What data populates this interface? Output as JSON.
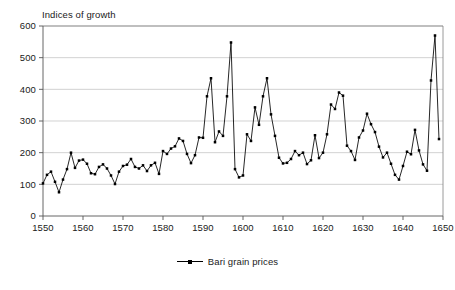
{
  "chart_data": {
    "type": "line",
    "title": "Indices of growth",
    "xlabel": "",
    "ylabel": "",
    "xlim": [
      1550,
      1650
    ],
    "ylim": [
      0,
      600
    ],
    "grid": true,
    "legend_position": "bottom",
    "ytick_labels": [
      "0",
      "100",
      "200",
      "300",
      "400",
      "500",
      "600"
    ],
    "ytick_values": [
      0,
      100,
      200,
      300,
      400,
      500,
      600
    ],
    "xtick_labels": [
      "1550",
      "1560",
      "1570",
      "1580",
      "1590",
      "1600",
      "1610",
      "1620",
      "1630",
      "1640",
      "1650"
    ],
    "xtick_values": [
      1550,
      1560,
      1570,
      1580,
      1590,
      1600,
      1610,
      1620,
      1630,
      1640,
      1650
    ],
    "series": [
      {
        "name": "Bari grain prices",
        "color": "#000000",
        "marker": "square",
        "x": [
          1550,
          1551,
          1552,
          1553,
          1554,
          1555,
          1556,
          1557,
          1558,
          1559,
          1560,
          1561,
          1562,
          1563,
          1564,
          1565,
          1566,
          1567,
          1568,
          1569,
          1570,
          1571,
          1572,
          1573,
          1574,
          1575,
          1576,
          1577,
          1578,
          1579,
          1580,
          1581,
          1582,
          1583,
          1584,
          1585,
          1586,
          1587,
          1588,
          1589,
          1590,
          1591,
          1592,
          1593,
          1594,
          1595,
          1596,
          1597,
          1598,
          1599,
          1600,
          1601,
          1602,
          1603,
          1604,
          1605,
          1606,
          1607,
          1608,
          1609,
          1610,
          1611,
          1612,
          1613,
          1614,
          1615,
          1616,
          1617,
          1618,
          1619,
          1620,
          1621,
          1622,
          1623,
          1624,
          1625,
          1626,
          1627,
          1628,
          1629,
          1630,
          1631,
          1632,
          1633,
          1634,
          1635,
          1636,
          1637,
          1638,
          1639,
          1640,
          1641,
          1642,
          1643,
          1644,
          1645,
          1646,
          1647,
          1648,
          1649
        ],
        "values": [
          103,
          130,
          140,
          108,
          75,
          115,
          148,
          200,
          152,
          175,
          178,
          165,
          135,
          132,
          155,
          163,
          150,
          128,
          101,
          140,
          158,
          162,
          180,
          155,
          150,
          160,
          142,
          160,
          168,
          133,
          205,
          196,
          213,
          220,
          245,
          237,
          196,
          167,
          192,
          248,
          247,
          378,
          435,
          233,
          267,
          253,
          378,
          548,
          148,
          122,
          128,
          258,
          237,
          343,
          288,
          378,
          435,
          321,
          253,
          184,
          166,
          168,
          180,
          205,
          192,
          200,
          164,
          176,
          255,
          183,
          200,
          258,
          352,
          338,
          390,
          380,
          222,
          205,
          177,
          248,
          270,
          323,
          290,
          265,
          219,
          185,
          200,
          165,
          130,
          115,
          158,
          203,
          195,
          272,
          207,
          163,
          143,
          428,
          570,
          243
        ]
      }
    ]
  },
  "legend": {
    "marker_name": "line-marker-swatch"
  }
}
